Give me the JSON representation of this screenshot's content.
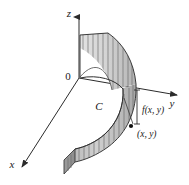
{
  "figure": {
    "background_color": "#ffffff",
    "axes": {
      "z_label": "z",
      "y_label": "y",
      "x_label": "x",
      "origin_label": "0",
      "axis_color": "#2b2b2b"
    },
    "labels": {
      "curve": "C",
      "height": "f(x, y)",
      "point": "(x, y)"
    },
    "colors": {
      "surface_fill_light": "#d9d9d9",
      "surface_fill_mid": "#c2c2c2",
      "surface_fill_dark": "#a8a8a8",
      "ruling_line": "#6e6e6e",
      "outline": "#3a3a3a",
      "plane_region": "#ffffff",
      "point_marker": "#111111"
    },
    "ruling_count_upper": 11,
    "ruling_count_lower": 12
  }
}
